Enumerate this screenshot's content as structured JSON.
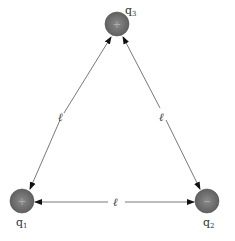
{
  "diagram": {
    "type": "equilateral triangle of point charges",
    "charges": [
      {
        "name": "q",
        "sub": "1",
        "sign": "+",
        "cx": 22,
        "cy": 201,
        "lx": 16,
        "ly": 226
      },
      {
        "name": "q",
        "sub": "2",
        "sign": "−",
        "cx": 207,
        "cy": 201,
        "lx": 203,
        "ly": 226
      },
      {
        "name": "q",
        "sub": "3",
        "sign": "+",
        "cx": 117,
        "cy": 24,
        "lx": 125,
        "ly": 14
      }
    ],
    "sides": [
      {
        "label": "ℓ",
        "between": "q1-q3"
      },
      {
        "label": "ℓ",
        "between": "q2-q3"
      },
      {
        "label": "ℓ",
        "between": "q1-q2"
      }
    ],
    "colors": {
      "charge_fill": "#6e6e6e",
      "line": "#444444"
    }
  }
}
